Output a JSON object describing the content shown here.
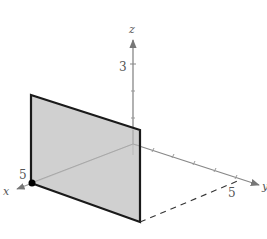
{
  "figure": {
    "type": "3d-coordinate-plot",
    "axes": {
      "x": {
        "label": "x",
        "tick_label": "5"
      },
      "y": {
        "label": "y",
        "tick_label": "5"
      },
      "z": {
        "label": "z",
        "tick_label": "3"
      }
    },
    "plane": {
      "description": "vertical plane x = 5 shown as shaded rectangle",
      "fill_color": "#c8c8c8",
      "edge_color": "#1a1a1a"
    },
    "point": {
      "description": "point on x-axis at x = 5",
      "color": "#000000"
    },
    "colors": {
      "axis": "#888888",
      "dashed": "#333333",
      "background": "#ffffff"
    }
  }
}
